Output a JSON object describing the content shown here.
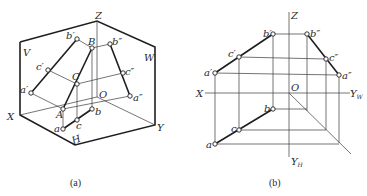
{
  "figure_a": {
    "caption": "(a)",
    "plane_labels": {
      "V": "V",
      "W": "W",
      "H": "H"
    },
    "axis_labels": {
      "X": "X",
      "Y": "Y",
      "Z": "Z",
      "O": "O"
    },
    "space_points": {
      "A": "A",
      "B": "B",
      "C": "C"
    },
    "v_projection": {
      "a": "a′",
      "b": "b′",
      "c": "c′"
    },
    "w_projection": {
      "a": "a″",
      "b": "b″",
      "c": "c″"
    },
    "h_projection": {
      "a": "a",
      "b": "b",
      "c": "c"
    }
  },
  "figure_b": {
    "caption": "(b)",
    "axis_labels": {
      "X": "X",
      "Z": "Z",
      "O": "O",
      "YW": "Y",
      "YW_sub": "W",
      "YH": "Y",
      "YH_sub": "H"
    },
    "v_projection": {
      "a": "a′",
      "b": "b′",
      "c": "c′"
    },
    "w_projection": {
      "a": "a″",
      "b": "b″",
      "c": "c″"
    },
    "h_projection": {
      "a": "a",
      "b": "b",
      "c": "c"
    }
  }
}
